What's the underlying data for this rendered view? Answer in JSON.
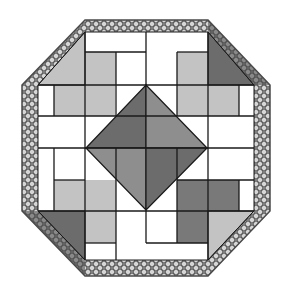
{
  "diagram": {
    "title": "",
    "type": "quilt-block",
    "shape": "octagon",
    "colors": {
      "background": "#ffffff",
      "white": "#ffffff",
      "light_gray": "#c3c3c3",
      "medium_gray": "#8e8e8e",
      "dark_gray": "#797979",
      "darker_gray": "#6c6c6c",
      "line": "#1a1a1a",
      "lace": "#6a6a6a",
      "lace_dark": "#4a4a4a"
    },
    "rects": [
      {
        "name": "top-left-upper-rect",
        "x": 85,
        "y": 52,
        "w": 31,
        "h": 33,
        "fill": "light_gray"
      },
      {
        "name": "top-white-cell-a",
        "x": 85,
        "y": 32,
        "w": 61,
        "h": 20,
        "fill": "white"
      },
      {
        "name": "top-white-cell-b",
        "x": 116,
        "y": 52,
        "w": 30,
        "h": 33,
        "fill": "white"
      },
      {
        "name": "top-white-cell-c",
        "x": 146,
        "y": 32,
        "w": 31,
        "h": 53,
        "fill": "white"
      },
      {
        "name": "top-right-upper-rect",
        "x": 177,
        "y": 52,
        "w": 31,
        "h": 64,
        "fill": "light_gray"
      },
      {
        "name": "top-white-cell-d",
        "x": 177,
        "y": 32,
        "w": 31,
        "h": 20,
        "fill": "white"
      },
      {
        "name": "left-upper-rect",
        "x": 54,
        "y": 85,
        "w": 61,
        "h": 31,
        "fill": "light_gray"
      },
      {
        "name": "left-white-cell-a",
        "x": 38,
        "y": 85,
        "w": 16,
        "h": 31,
        "fill": "white"
      },
      {
        "name": "right-upper-rect",
        "x": 208,
        "y": 85,
        "w": 31,
        "h": 31,
        "fill": "light_gray"
      },
      {
        "name": "right-white-cell-a",
        "x": 239,
        "y": 85,
        "w": 15,
        "h": 31,
        "fill": "white"
      },
      {
        "name": "left-band-white",
        "x": 38,
        "y": 116,
        "w": 108,
        "h": 32,
        "fill": "white"
      },
      {
        "name": "right-band-white",
        "x": 146,
        "y": 116,
        "w": 108,
        "h": 32,
        "fill": "white"
      },
      {
        "name": "left-lower-white-a",
        "x": 38,
        "y": 148,
        "w": 16,
        "h": 63,
        "fill": "white"
      },
      {
        "name": "left-lower-white-b",
        "x": 54,
        "y": 148,
        "w": 31,
        "h": 32,
        "fill": "white"
      },
      {
        "name": "left-lower-rect",
        "x": 54,
        "y": 180,
        "w": 31,
        "h": 31,
        "fill": "light_gray"
      },
      {
        "name": "bottom-left-rect",
        "x": 85,
        "y": 180,
        "w": 31,
        "h": 63,
        "fill": "light_gray"
      },
      {
        "name": "bottom-white-a",
        "x": 85,
        "y": 243,
        "w": 31,
        "h": 17,
        "fill": "white"
      },
      {
        "name": "bottom-white-b",
        "x": 116,
        "y": 148,
        "w": 30,
        "h": 112,
        "fill": "white"
      },
      {
        "name": "bottom-white-c",
        "x": 146,
        "y": 211,
        "w": 31,
        "h": 32,
        "fill": "white"
      },
      {
        "name": "bottom-white-d",
        "x": 146,
        "y": 243,
        "w": 62,
        "h": 17,
        "fill": "white"
      },
      {
        "name": "right-lower-white-a",
        "x": 177,
        "y": 148,
        "w": 77,
        "h": 32,
        "fill": "white"
      },
      {
        "name": "right-lower-dark-rect",
        "x": 177,
        "y": 180,
        "w": 62,
        "h": 31,
        "fill": "dark_gray"
      },
      {
        "name": "right-lower-white-b",
        "x": 239,
        "y": 180,
        "w": 15,
        "h": 31,
        "fill": "white"
      },
      {
        "name": "bottom-right-dark-rect",
        "x": 177,
        "y": 211,
        "w": 31,
        "h": 32,
        "fill": "dark_gray"
      }
    ],
    "corner_triangles": [
      {
        "name": "top-left-corner-triangle",
        "points": "85,32 85,85 38,85",
        "fill": "light_gray"
      },
      {
        "name": "top-right-corner-triangle",
        "points": "208,32 208,85 254,85",
        "fill": "darker_gray"
      },
      {
        "name": "bottom-left-corner-triangle",
        "points": "38,211 85,211 85,260",
        "fill": "darker_gray"
      },
      {
        "name": "bottom-right-corner-triangle",
        "points": "208,211 254,211 208,260",
        "fill": "light_gray"
      }
    ],
    "diamond": {
      "center": [
        146,
        148
      ],
      "top": [
        146,
        85
      ],
      "right": [
        207,
        148
      ],
      "bottom": [
        146,
        210
      ],
      "left": [
        86,
        148
      ],
      "quadrants": [
        {
          "name": "diamond-top-left",
          "points": "146,85 146,148 86,148",
          "fill": "darker_gray"
        },
        {
          "name": "diamond-top-right",
          "points": "146,85 207,148 146,148",
          "fill": "medium_gray"
        },
        {
          "name": "diamond-bottom-left",
          "points": "86,148 146,148 146,210",
          "fill": "medium_gray"
        },
        {
          "name": "diamond-bottom-right",
          "points": "146,148 207,148 146,210",
          "fill": "darker_gray"
        }
      ]
    },
    "grid_lines": [
      "85,32 85,260",
      "146,32 146,85",
      "208,32 208,260",
      "116,52 116,116",
      "177,52 177,116",
      "54,85 54,116",
      "239,85 239,116",
      "85,52 146,52",
      "177,52 208,52",
      "38,85 254,85",
      "38,116 254,116",
      "38,148 254,148",
      "54,148 54,211",
      "116,148 116,260",
      "177,148 177,243",
      "239,180 239,211",
      "54,180 85,180",
      "177,180 254,180",
      "38,211 254,211",
      "85,243 116,243",
      "146,211 146,243",
      "146,243 208,243"
    ],
    "lace_border": {
      "outer": "85,20 208,20 270,85 270,211 208,276 85,276 22,211 22,85",
      "inner": "85,32 208,32 254,85 254,211 208,260 85,260 38,211 38,85",
      "width": 14
    }
  }
}
